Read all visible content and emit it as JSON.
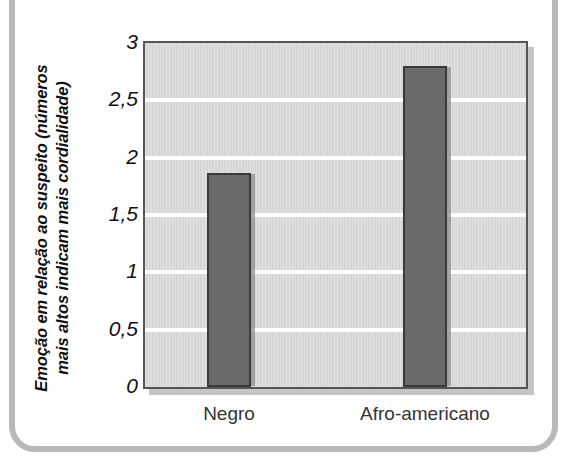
{
  "figure": {
    "frame_color": "#b9b9b9"
  },
  "chart_data": {
    "type": "bar",
    "title": "",
    "xlabel": "",
    "ylabel_lines": [
      "Emoção em relação ao suspeito (números",
      "mais altos indicam mais cordialidade)"
    ],
    "ylabel": "Emoção em relação ao suspeito (números mais altos indicam mais cordialidade)",
    "categories": [
      "Negro",
      "Afro-americano"
    ],
    "values": [
      1.87,
      2.8
    ],
    "ylim": [
      0,
      3
    ],
    "ytick_labels": [
      "0",
      "0,5",
      "1",
      "1,5",
      "2",
      "2,5",
      "3"
    ],
    "ytick_values": [
      0,
      0.5,
      1,
      1.5,
      2,
      2.5,
      3
    ],
    "grid": true,
    "gridline_color": "#ffffff",
    "legend": null,
    "bar_color": "#6a6a6a",
    "bar_edge_color": "#3a3a3a",
    "plot_background": "#d6d6d6"
  }
}
